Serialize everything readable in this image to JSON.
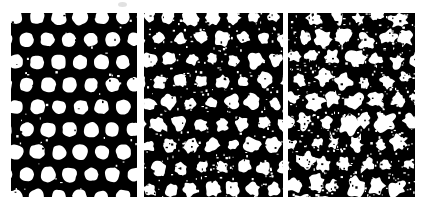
{
  "figure": {
    "width": 427,
    "height": 213,
    "background_color": "#ffffff",
    "foreground_color": "#ffffff",
    "matrix_color": "#000000",
    "panel_count": 3
  },
  "panels": [
    {
      "id": "panel-a",
      "name": "left-panel",
      "label": "",
      "x": 11,
      "y": 13,
      "width": 126,
      "height": 184,
      "lattice": {
        "type": "staggered-hexagonal",
        "period_x": 21.5,
        "period_y": 22.5,
        "row_offset_x": 10.75,
        "dot_radius": 7.2,
        "columns": 6,
        "rows": 9
      },
      "noise": {
        "edge_roughness": 0.1,
        "position_jitter": 0.35,
        "radius_jitter": 0.07,
        "speckle_density": 0.004,
        "merge_probability": 0.0,
        "dropout_probability": 0.0
      }
    },
    {
      "id": "panel-b",
      "name": "middle-panel",
      "label": "",
      "x": 144,
      "y": 13,
      "width": 139,
      "height": 184,
      "lattice": {
        "type": "staggered-hexagonal",
        "period_x": 21.0,
        "period_y": 21.5,
        "row_offset_x": 10.5,
        "dot_radius": 6.4,
        "columns": 7,
        "rows": 9
      },
      "noise": {
        "edge_roughness": 0.3,
        "position_jitter": 1.4,
        "radius_jitter": 0.2,
        "speckle_density": 0.02,
        "merge_probability": 0.02,
        "dropout_probability": 0.0
      }
    },
    {
      "id": "panel-c",
      "name": "right-panel",
      "label": "",
      "x": 288,
      "y": 13,
      "width": 127,
      "height": 184,
      "lattice": {
        "type": "staggered-hexagonal",
        "period_x": 21.0,
        "period_y": 21.0,
        "row_offset_x": 10.5,
        "dot_radius": 6.9,
        "columns": 7,
        "rows": 9
      },
      "noise": {
        "edge_roughness": 0.46,
        "position_jitter": 2.9,
        "radius_jitter": 0.3,
        "speckle_density": 0.032,
        "merge_probability": 0.22,
        "dropout_probability": 0.03
      }
    }
  ],
  "artifacts": [
    {
      "name": "top-center-speck",
      "x": 118,
      "y": 2,
      "width": 9,
      "height": 5
    }
  ]
}
